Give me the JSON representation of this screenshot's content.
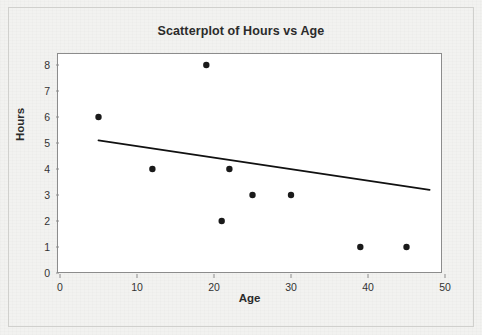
{
  "chart_data": {
    "type": "scatter",
    "title": "Scatterplot of Hours vs Age",
    "xlabel": "Age",
    "ylabel": "Hours",
    "xlim": [
      0,
      50
    ],
    "ylim": [
      0,
      8
    ],
    "xticks": [
      0,
      10,
      20,
      30,
      40,
      50
    ],
    "yticks": [
      0,
      1,
      2,
      3,
      4,
      5,
      6,
      7,
      8
    ],
    "grid": false,
    "legend": false,
    "marker": "filled-circle",
    "marker_color": "#1a1a1a",
    "points": [
      {
        "x": 5,
        "y": 6
      },
      {
        "x": 12,
        "y": 4
      },
      {
        "x": 19,
        "y": 8
      },
      {
        "x": 21,
        "y": 2
      },
      {
        "x": 22,
        "y": 4
      },
      {
        "x": 25,
        "y": 3
      },
      {
        "x": 30,
        "y": 3
      },
      {
        "x": 39,
        "y": 1
      },
      {
        "x": 45,
        "y": 1
      }
    ],
    "series": [
      {
        "name": "Hours vs Age",
        "type": "scatter",
        "x": [
          5,
          12,
          19,
          21,
          22,
          25,
          30,
          39,
          45
        ],
        "values": [
          6,
          4,
          8,
          2,
          4,
          3,
          3,
          1,
          1
        ]
      },
      {
        "name": "fitted regression line",
        "type": "line",
        "color": "#111111",
        "x": [
          5,
          48
        ],
        "values": [
          5.1,
          3.2
        ]
      }
    ],
    "trendline": {
      "x_start": 5,
      "y_start": 5.1,
      "x_end": 48,
      "y_end": 3.2,
      "slope": -0.044,
      "intercept": 5.32
    }
  },
  "figure": {
    "background_color": "#f2f2f0",
    "plot_background_color": "#ffffff",
    "border_color": "#d0d0cd",
    "axis_color": "#8c8c8c"
  }
}
